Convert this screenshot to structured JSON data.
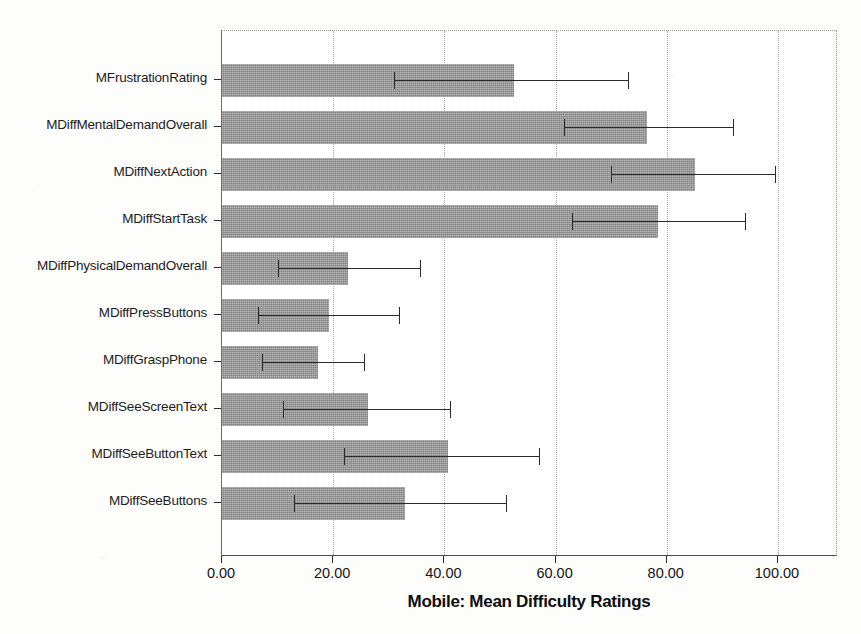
{
  "chart_data": {
    "type": "bar",
    "orientation": "horizontal",
    "title": "",
    "xlabel": "Mobile: Mean Difficulty Ratings",
    "ylabel": "",
    "xlim": [
      0,
      110.8
    ],
    "xticks": [
      0,
      20,
      40,
      60,
      80,
      100
    ],
    "xtick_labels": [
      "0.00",
      "20.00",
      "40.00",
      "60.00",
      "80.00",
      "100.00"
    ],
    "grid": "vertical-dotted",
    "legend": "none",
    "bar_color": "#969696",
    "error_bar_color": "#2b2b2b",
    "categories": [
      "MFrustrationRating",
      "MDiffMentalDemandOverall",
      "MDiffNextAction",
      "MDiffStartTask",
      "MDiffPhysicalDemandOverall",
      "MDiffPressButtons",
      "MDiffGraspPhone",
      "MDiffSeeScreenText",
      "MDiffSeeButtonText",
      "MDiffSeeButtons"
    ],
    "values": [
      52.5,
      76.5,
      85.0,
      78.5,
      22.7,
      19.2,
      17.2,
      26.2,
      40.7,
      33.0
    ],
    "error_low": [
      31.0,
      61.5,
      70.0,
      63.0,
      10.0,
      6.4,
      7.2,
      11.0,
      22.0,
      13.0
    ],
    "error_high": [
      73.0,
      92.0,
      99.5,
      94.0,
      35.7,
      31.8,
      25.5,
      41.0,
      57.0,
      51.0
    ],
    "series": [
      {
        "name": "Mean Difficulty Rating",
        "values": [
          52.5,
          76.5,
          85.0,
          78.5,
          22.7,
          19.2,
          17.2,
          26.2,
          40.7,
          33.0
        ]
      }
    ]
  },
  "axis_title": "Mobile: Mean Difficulty Ratings"
}
